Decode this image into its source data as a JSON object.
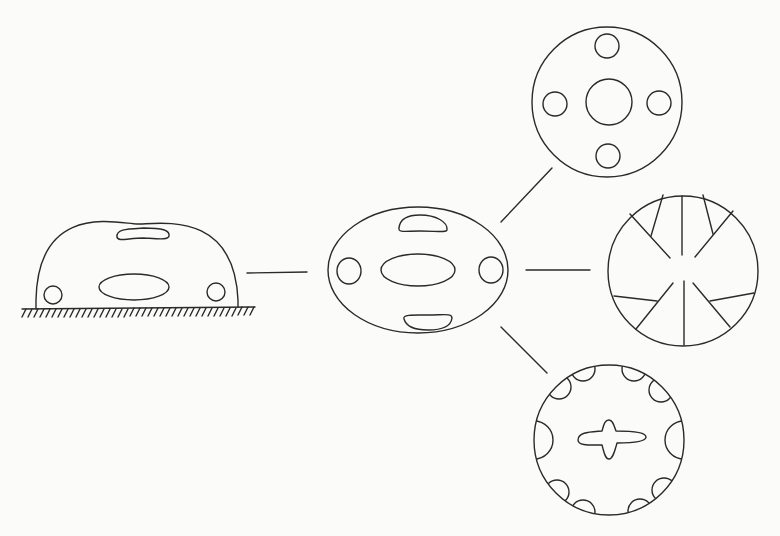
{
  "diagram": {
    "colors": {
      "background": "#fbfbf9",
      "stroke": "#2a2a2a"
    },
    "nodes": [
      {
        "id": "dome-on-ground",
        "shape": "half-ellipse with slots and holes on hatched ground"
      },
      {
        "id": "ellipse-body",
        "shape": "ellipse with two curved slots, central oval and two side holes"
      },
      {
        "id": "circle-holes",
        "shape": "circle with central hole and four peripheral holes"
      },
      {
        "id": "circle-radial",
        "shape": "circle with radial spokes and forked branches"
      },
      {
        "id": "circle-scalloped",
        "shape": "circle with edge semicircles and central cross-shaped slot"
      }
    ],
    "edges": [
      {
        "from": "dome-on-ground",
        "to": "ellipse-body"
      },
      {
        "from": "ellipse-body",
        "to": "circle-holes"
      },
      {
        "from": "ellipse-body",
        "to": "circle-radial"
      },
      {
        "from": "ellipse-body",
        "to": "circle-scalloped"
      }
    ]
  }
}
